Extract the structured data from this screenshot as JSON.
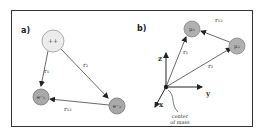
{
  "panels": [
    {
      "id": "a",
      "label": "a)",
      "nodes": [
        {
          "id": "center",
          "label": "++",
          "fill": "#e8e8e8"
        },
        {
          "id": "particle1",
          "label": "e⁻₁",
          "fill": "#a9a9a9"
        },
        {
          "id": "particle2",
          "label": "e⁻₂",
          "fill": "#a9a9a9"
        }
      ],
      "edges": [
        {
          "from": "center",
          "to": "particle1",
          "label": "r₁"
        },
        {
          "from": "center",
          "to": "particle2",
          "label": "r₂"
        },
        {
          "from": "particle2",
          "to": "particle1",
          "label": "r₁₂"
        }
      ]
    },
    {
      "id": "b",
      "label": "b)",
      "nodes": [
        {
          "id": "m1",
          "label": "μ₁",
          "fill": "#b0b0b0"
        },
        {
          "id": "m2",
          "label": "μ₂",
          "fill": "#b0b0b0"
        },
        {
          "id": "origin",
          "label": "",
          "fill": "#222222"
        }
      ],
      "edges": [
        {
          "from": "origin",
          "to": "m1",
          "label": "r₁"
        },
        {
          "from": "origin",
          "to": "m2",
          "label": "r₂"
        },
        {
          "from": "m2",
          "to": "m1",
          "label": "r₁₂"
        }
      ],
      "axes": {
        "x": "x",
        "y": "y",
        "z": "z"
      },
      "annotation": {
        "line1": "center",
        "line2": "of mass"
      }
    }
  ]
}
